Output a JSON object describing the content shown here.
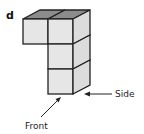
{
  "panel_label": "d",
  "labels": {
    "side": "Side",
    "front": "Front"
  },
  "colors": {
    "front_face": "#e6e6e6",
    "side_face": "#dcdcdc",
    "top_face": "#8c8c8c",
    "stroke": "#222222"
  }
}
